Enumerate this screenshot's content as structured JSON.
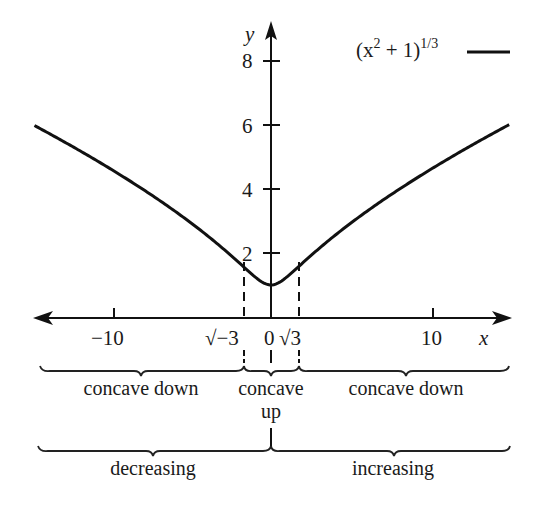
{
  "chart_data": {
    "type": "line",
    "title": "",
    "xlabel": "x",
    "ylabel": "y",
    "xlim": [
      -14.6,
      14.7
    ],
    "ylim": [
      0,
      9
    ],
    "grid": false,
    "legend_position": "top-right",
    "x_ticks": [
      {
        "value": -10,
        "label": "−10"
      },
      {
        "value": 10,
        "label": "10"
      }
    ],
    "special_x_marks": [
      {
        "value": -1.732,
        "label": "√−3",
        "dashed": true
      },
      {
        "value": 0,
        "label": "0",
        "dashed": false
      },
      {
        "value": 1.732,
        "label": "√3",
        "dashed": true
      }
    ],
    "y_ticks": [
      {
        "value": 2,
        "label": "2"
      },
      {
        "value": 4,
        "label": "4"
      },
      {
        "value": 6,
        "label": "6"
      },
      {
        "value": 8,
        "label": "8"
      }
    ],
    "series": [
      {
        "name": "(x^2 + 1)^(1/3)",
        "function": "(x^2+1)^(1/3)",
        "x": [
          -14.6,
          -12,
          -10,
          -8,
          -6,
          -4,
          -2,
          -1.732,
          -1,
          0,
          1,
          1.732,
          2,
          4,
          6,
          8,
          10,
          12,
          14.7
        ],
        "values": [
          5.98,
          5.25,
          4.66,
          4.02,
          3.33,
          2.57,
          1.71,
          1.59,
          1.26,
          1.0,
          1.26,
          1.59,
          1.71,
          2.57,
          3.33,
          4.02,
          4.66,
          5.25,
          6.0
        ],
        "color": "#111111"
      }
    ],
    "legend": {
      "base": "(x",
      "exp": "2",
      "mid": " + 1)",
      "power": "1/3"
    },
    "annotations": {
      "concavity": [
        {
          "label": "concave down",
          "from": "-inf",
          "to": "-√3"
        },
        {
          "label": "concave",
          "label2": "up",
          "from": "-√3",
          "to": "√3"
        },
        {
          "label": "concave down",
          "from": "√3",
          "to": "inf"
        }
      ],
      "monotonicity": [
        {
          "label": "decreasing",
          "from": "-inf",
          "to": "0"
        },
        {
          "label": "increasing",
          "from": "0",
          "to": "inf"
        }
      ]
    }
  }
}
